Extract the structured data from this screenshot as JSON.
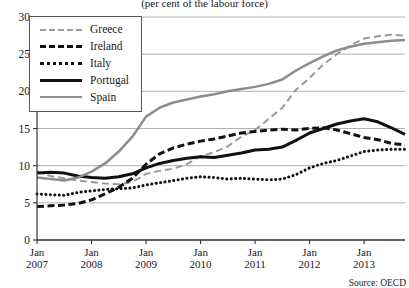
{
  "subtitle": "(per cent of the labour force)",
  "source": "Source: OECD",
  "legend": {
    "items": [
      {
        "label": "Greece",
        "key": "k-greece"
      },
      {
        "label": "Ireland",
        "key": "k-ireland"
      },
      {
        "label": "Italy",
        "key": "k-italy"
      },
      {
        "label": "Portugal",
        "key": "k-portugal"
      },
      {
        "label": "Spain",
        "key": "k-spain"
      }
    ]
  },
  "chart_data": {
    "type": "line",
    "title": "",
    "subtitle": "(per cent of the labour force)",
    "xlabel": "",
    "ylabel": "",
    "ylim": [
      0,
      30
    ],
    "yticks": [
      0,
      5,
      10,
      15,
      20,
      25,
      30
    ],
    "grid": true,
    "legend_position": "top-left",
    "source": "Source: OECD",
    "xtick_labels": [
      {
        "line1": "Jan",
        "line2": "2007"
      },
      {
        "line1": "Jan",
        "line2": "2008"
      },
      {
        "line1": "Jan",
        "line2": "2009"
      },
      {
        "line1": "Jan",
        "line2": "2010"
      },
      {
        "line1": "Jan",
        "line2": "2011"
      },
      {
        "line1": "Jan",
        "line2": "2012"
      },
      {
        "line1": "Jan",
        "line2": "2013"
      }
    ],
    "x": [
      2007.0,
      2007.25,
      2007.5,
      2007.75,
      2008.0,
      2008.25,
      2008.5,
      2008.75,
      2009.0,
      2009.25,
      2009.5,
      2009.75,
      2010.0,
      2010.25,
      2010.5,
      2010.75,
      2011.0,
      2011.25,
      2011.5,
      2011.75,
      2012.0,
      2012.25,
      2012.5,
      2012.75,
      2013.0,
      2013.25,
      2013.5,
      2013.75
    ],
    "series": [
      {
        "name": "Greece",
        "color": "#9a9a9a",
        "style": "dashed",
        "width": 2,
        "values": [
          9.2,
          8.6,
          8.3,
          8.0,
          7.8,
          7.6,
          7.5,
          7.8,
          8.9,
          9.3,
          9.6,
          10.2,
          11.3,
          11.8,
          12.6,
          13.9,
          14.8,
          16.3,
          17.8,
          20.2,
          21.8,
          23.6,
          25.0,
          26.2,
          27.1,
          27.4,
          27.6,
          27.5
        ]
      },
      {
        "name": "Ireland",
        "color": "#111111",
        "style": "dashed-thick",
        "width": 3,
        "values": [
          4.5,
          4.6,
          4.7,
          4.9,
          5.4,
          6.2,
          7.1,
          8.3,
          10.2,
          11.6,
          12.4,
          12.9,
          13.3,
          13.6,
          14.0,
          14.4,
          14.6,
          14.8,
          14.9,
          14.8,
          15.0,
          15.1,
          14.8,
          14.3,
          13.8,
          13.5,
          13.0,
          12.8
        ]
      },
      {
        "name": "Italy",
        "color": "#111111",
        "style": "dotted",
        "width": 3,
        "values": [
          6.2,
          6.1,
          6.0,
          6.4,
          6.6,
          6.8,
          6.9,
          7.0,
          7.4,
          7.7,
          8.0,
          8.3,
          8.5,
          8.4,
          8.2,
          8.3,
          8.2,
          8.1,
          8.2,
          8.8,
          9.7,
          10.3,
          10.7,
          11.3,
          11.9,
          12.1,
          12.2,
          12.2
        ]
      },
      {
        "name": "Portugal",
        "color": "#111111",
        "style": "solid-thick",
        "width": 3,
        "values": [
          9.0,
          9.1,
          9.0,
          8.6,
          8.4,
          8.3,
          8.5,
          8.9,
          9.7,
          10.3,
          10.7,
          11.0,
          11.2,
          11.1,
          11.4,
          11.7,
          12.1,
          12.2,
          12.5,
          13.4,
          14.4,
          15.0,
          15.6,
          16.0,
          16.3,
          15.9,
          15.1,
          14.2
        ]
      },
      {
        "name": "Spain",
        "color": "#8d8d8d",
        "style": "solid",
        "width": 2.5,
        "values": [
          8.4,
          8.2,
          8.0,
          8.4,
          9.2,
          10.3,
          11.9,
          13.9,
          16.6,
          17.8,
          18.5,
          18.9,
          19.3,
          19.6,
          20.0,
          20.3,
          20.6,
          21.0,
          21.6,
          22.8,
          23.8,
          24.7,
          25.5,
          26.0,
          26.4,
          26.6,
          26.8,
          26.9
        ]
      }
    ]
  }
}
